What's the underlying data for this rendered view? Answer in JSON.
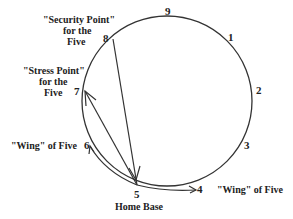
{
  "diagram": {
    "points": [
      {
        "n": "9",
        "x": 165,
        "y": 15
      },
      {
        "n": "1",
        "x": 229,
        "y": 40
      },
      {
        "n": "2",
        "x": 257,
        "y": 93
      },
      {
        "n": "3",
        "x": 245,
        "y": 149
      },
      {
        "n": "4",
        "x": 196,
        "y": 191
      },
      {
        "n": "5",
        "x": 134,
        "y": 196
      },
      {
        "n": "6",
        "x": 85,
        "y": 149
      },
      {
        "n": "7",
        "x": 74,
        "y": 94
      },
      {
        "n": "8",
        "x": 104,
        "y": 41
      }
    ],
    "labels": {
      "security": [
        "\"Security Point\"",
        "for the",
        "Five"
      ],
      "stress": [
        "\"Stress Point\"",
        "for the",
        "Five"
      ],
      "wing_left": "\"Wing\" of Five",
      "wing_right": "\"Wing\" of Five",
      "home": "Home Base"
    },
    "colors": {
      "stroke": "#333333",
      "text": "#222222"
    }
  }
}
